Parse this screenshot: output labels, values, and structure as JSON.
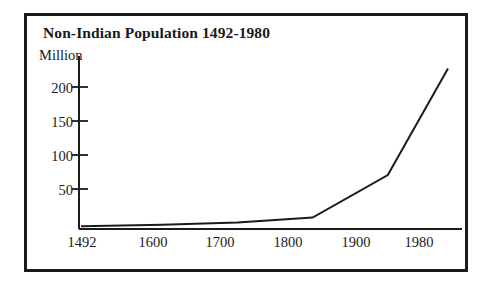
{
  "figure": {
    "title": "Non-Indian Population 1492-1980",
    "y_axis_caption": "Million",
    "frame_color": "#1b1b1b",
    "line_color": "#1b1b1b",
    "background_color": "#ffffff"
  },
  "chart_data": {
    "type": "line",
    "title": "Non-Indian Population 1492-1980",
    "xlabel": "",
    "ylabel": "Million",
    "x": [
      1492,
      1600,
      1700,
      1800,
      1900,
      1980
    ],
    "values": [
      4,
      6,
      9,
      16,
      76,
      226
    ],
    "series": [
      {
        "name": "Non-Indian Population",
        "values": [
          4,
          6,
          9,
          16,
          76,
          226
        ]
      }
    ],
    "categories": [
      "1492",
      "1600",
      "1700",
      "1800",
      "1900",
      "1980"
    ],
    "x_tick_labels": [
      "1492",
      "1600",
      "1700",
      "1800",
      "1900",
      "1980"
    ],
    "y_tick_labels": [
      "200",
      "150",
      "100",
      "50"
    ],
    "y_ticks": [
      200,
      150,
      100,
      50
    ],
    "xlim": [
      1492,
      1980
    ],
    "ylim": [
      0,
      230
    ],
    "grid": false,
    "legend": false,
    "units": "Million"
  }
}
